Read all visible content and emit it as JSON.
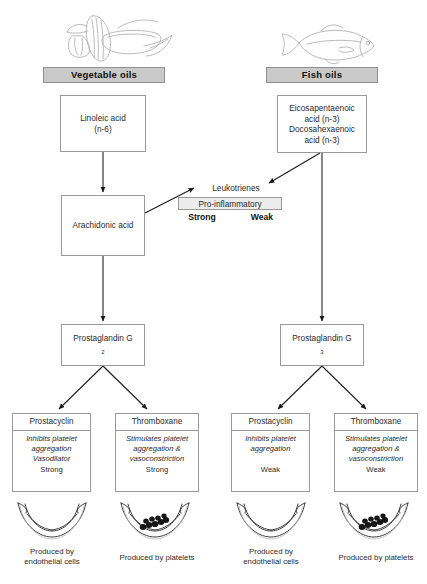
{
  "diagram": {
    "columns": [
      {
        "id": "vegetable",
        "header": "Vegetable oils",
        "illustration": "vegetables-corn-sketch-icon",
        "precursor": {
          "line1": "Linoleic acid",
          "line2": "(n-6)"
        },
        "intermediate": "Arachidonic acid",
        "prostaglandin": {
          "name": "Prostaglandin G",
          "subscript": "2"
        },
        "potency": "Strong"
      },
      {
        "id": "fish",
        "header": "Fish oils",
        "illustration": "fish-sketch-icon",
        "precursor": {
          "line1": "Eicosapentaenoic",
          "line2": "acid (n-3)",
          "line3": "Docosahexaenoic",
          "line4": "acid (n-3)"
        },
        "prostaglandin": {
          "name": "Prostaglandin G",
          "subscript": "3"
        },
        "potency": "Weak"
      }
    ],
    "leukotrienes": {
      "label": "Leukotrienes",
      "strip": "Pro-inflammatory",
      "left_potency": "Strong",
      "right_potency": "Weak"
    },
    "effectors": [
      {
        "id": "prostacyclin-veg",
        "title": "Prostacyclin",
        "effect_line1": "Inhibits platelet",
        "effect_line2": "aggregation",
        "effect_line3": "Vasodilator",
        "potency": "Strong",
        "source": {
          "line1": "Produced by",
          "line2": "endothelial cells"
        },
        "vessel": "vessel-endothelium-icon",
        "has_platelets": false
      },
      {
        "id": "thromboxane-veg",
        "title": "Thromboxane",
        "effect_line1": "Stimulates platelet",
        "effect_line2": "aggregation &",
        "effect_line3": "vasoconstriction",
        "potency": "Strong",
        "source": {
          "line1": "Produced by platelets",
          "line2": ""
        },
        "vessel": "vessel-platelets-icon",
        "has_platelets": true
      },
      {
        "id": "prostacyclin-fish",
        "title": "Prostacyclin",
        "effect_line1": "Inhibits platelet",
        "effect_line2": "aggregation",
        "effect_line3": "",
        "potency": "Weak",
        "source": {
          "line1": "Produced by",
          "line2": "endothelial cells"
        },
        "vessel": "vessel-endothelium-icon",
        "has_platelets": false
      },
      {
        "id": "thromboxane-fish",
        "title": "Thromboxane",
        "effect_line1": "Stimulates platelet",
        "effect_line2": "aggregation &",
        "effect_line3": "vasoconstriction",
        "potency": "Weak",
        "source": {
          "line1": "Produced by platelets",
          "line2": ""
        },
        "vessel": "vessel-platelets-icon",
        "has_platelets": true
      }
    ],
    "colors": {
      "header_fill": "#c9c9c9",
      "strip_fill": "#ececec",
      "border": "#9a9a9a",
      "arrow": "#1a1a1a",
      "text": "#2b2b2b"
    }
  }
}
